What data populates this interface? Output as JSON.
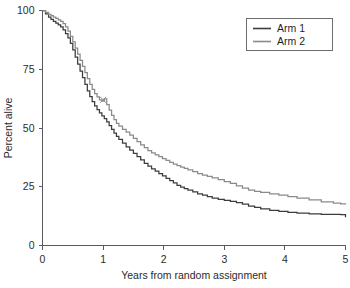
{
  "chart_data": {
    "type": "line",
    "title": "",
    "subtitle": "",
    "xlabel": "Years from random assignment",
    "ylabel": "Percent alive",
    "xlim": [
      0,
      5
    ],
    "ylim": [
      0,
      100
    ],
    "xticks": [
      0,
      1,
      2,
      3,
      4,
      5
    ],
    "xtick_labels": [
      "0",
      "1",
      "2",
      "3",
      "4",
      "5"
    ],
    "yticks": [
      0,
      25,
      50,
      75,
      100
    ],
    "ytick_labels": [
      "0",
      "25",
      "50",
      "75",
      "100"
    ],
    "grid": false,
    "legend_position": "top-right",
    "legend_entries": [
      "Arm 1",
      "Arm 2"
    ],
    "series": [
      {
        "name": "Arm 1",
        "color": "#3c3c3c",
        "x": [
          0.0,
          0.05,
          0.1,
          0.14,
          0.18,
          0.22,
          0.26,
          0.3,
          0.34,
          0.38,
          0.42,
          0.46,
          0.5,
          0.54,
          0.58,
          0.62,
          0.66,
          0.7,
          0.74,
          0.78,
          0.82,
          0.86,
          0.9,
          0.94,
          0.98,
          1.02,
          1.06,
          1.1,
          1.14,
          1.18,
          1.22,
          1.26,
          1.32,
          1.38,
          1.44,
          1.5,
          1.56,
          1.62,
          1.68,
          1.74,
          1.8,
          1.86,
          1.92,
          1.98,
          2.04,
          2.1,
          2.16,
          2.22,
          2.28,
          2.34,
          2.4,
          2.48,
          2.56,
          2.64,
          2.72,
          2.8,
          2.9,
          3.0,
          3.1,
          3.2,
          3.3,
          3.4,
          3.5,
          3.6,
          3.75,
          3.9,
          4.05,
          4.2,
          4.4,
          4.6,
          4.8,
          4.92,
          5.0
        ],
        "y": [
          100.0,
          98.6,
          97.2,
          96.2,
          95.4,
          94.6,
          93.9,
          93.0,
          91.8,
          90.2,
          88.4,
          86.0,
          83.2,
          80.2,
          77.2,
          74.2,
          71.4,
          68.6,
          65.8,
          63.4,
          61.2,
          59.4,
          57.8,
          56.4,
          55.2,
          54.0,
          52.6,
          51.0,
          49.4,
          47.8,
          46.4,
          45.2,
          43.6,
          42.0,
          40.6,
          39.2,
          37.8,
          36.4,
          35.0,
          33.8,
          32.6,
          31.6,
          30.6,
          29.6,
          28.6,
          27.6,
          26.6,
          25.6,
          24.8,
          24.2,
          23.6,
          22.8,
          22.0,
          21.4,
          20.8,
          20.2,
          19.6,
          19.2,
          18.8,
          18.3,
          17.6,
          16.8,
          16.2,
          15.6,
          15.0,
          14.5,
          14.1,
          13.8,
          13.5,
          13.3,
          13.2,
          13.1,
          12.0
        ]
      },
      {
        "name": "Arm 2",
        "color": "#8a8a8a",
        "x": [
          0.0,
          0.05,
          0.1,
          0.14,
          0.18,
          0.22,
          0.26,
          0.3,
          0.34,
          0.38,
          0.42,
          0.46,
          0.5,
          0.54,
          0.58,
          0.62,
          0.66,
          0.7,
          0.74,
          0.78,
          0.82,
          0.86,
          0.9,
          0.94,
          0.98,
          1.02,
          1.06,
          1.1,
          1.14,
          1.18,
          1.22,
          1.26,
          1.32,
          1.38,
          1.44,
          1.5,
          1.56,
          1.62,
          1.68,
          1.74,
          1.8,
          1.86,
          1.92,
          1.98,
          2.04,
          2.1,
          2.16,
          2.22,
          2.28,
          2.34,
          2.4,
          2.48,
          2.56,
          2.64,
          2.72,
          2.8,
          2.9,
          3.0,
          3.1,
          3.2,
          3.3,
          3.4,
          3.5,
          3.6,
          3.75,
          3.9,
          4.05,
          4.2,
          4.4,
          4.6,
          4.8,
          4.92,
          5.0
        ],
        "y": [
          100.0,
          99.2,
          98.4,
          97.8,
          97.2,
          96.6,
          96.0,
          95.4,
          94.4,
          93.0,
          91.2,
          89.0,
          86.6,
          84.0,
          81.4,
          78.8,
          76.2,
          73.6,
          71.0,
          68.6,
          66.4,
          64.6,
          63.2,
          62.0,
          61.4,
          62.4,
          60.0,
          57.6,
          55.4,
          53.6,
          52.0,
          50.8,
          49.4,
          48.2,
          47.0,
          45.6,
          44.2,
          42.8,
          41.6,
          40.4,
          39.4,
          38.6,
          37.8,
          37.0,
          36.2,
          35.4,
          34.6,
          34.0,
          33.4,
          32.8,
          32.2,
          31.4,
          30.6,
          30.0,
          29.4,
          28.8,
          28.0,
          27.2,
          26.4,
          25.4,
          24.4,
          23.6,
          23.0,
          22.6,
          22.0,
          21.4,
          20.8,
          20.2,
          19.4,
          18.6,
          18.0,
          17.7,
          17.5
        ]
      }
    ],
    "censor_marks": [
      {
        "series": "Arm 2",
        "x": 1.0,
        "y": 62.0
      }
    ]
  },
  "axes": {
    "x_title": "Years from random assignment",
    "y_title": "Percent alive"
  },
  "legend": {
    "items": [
      {
        "label": "Arm 1",
        "color": "#3c3c3c"
      },
      {
        "label": "Arm 2",
        "color": "#8a8a8a"
      }
    ]
  }
}
